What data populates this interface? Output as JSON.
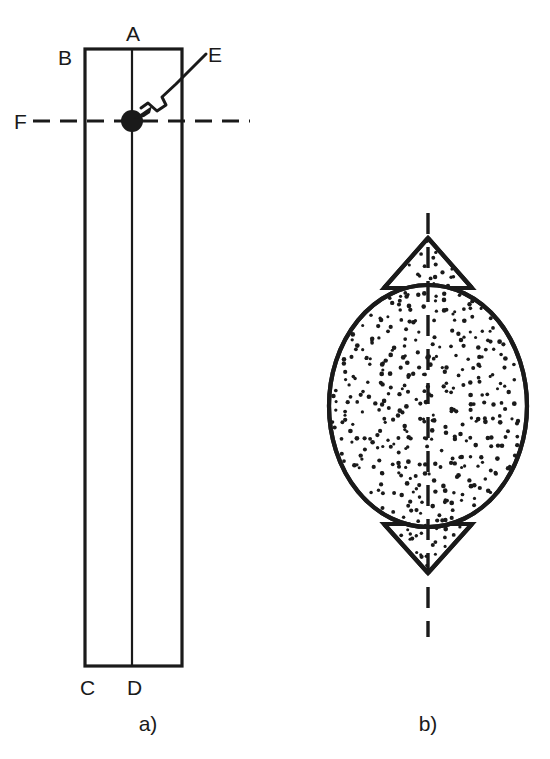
{
  "figure": {
    "background_color": "#ffffff",
    "ink_color": "#1a1a1a"
  },
  "panel_a": {
    "caption": "a)",
    "labels": {
      "top_center": "A",
      "top_left": "B",
      "bottom_left": "C",
      "bottom_center": "D",
      "left_axis": "F",
      "callout": "E"
    },
    "geometry": {
      "rect_left_x": 85,
      "rect_right_x": 182,
      "rect_top_y": 49,
      "rect_bottom_y": 666,
      "center_line_x": 132,
      "horizontal_dashed_y": 121,
      "horizontal_dashed_x1": 33,
      "horizontal_dashed_x2": 250,
      "marker_dot_x": 132,
      "marker_dot_y": 121,
      "marker_dot_r": 11
    }
  },
  "panel_b": {
    "caption": "b)",
    "geometry": {
      "ellipse_center_x": 428,
      "ellipse_center_y": 406,
      "ellipse_rx": 99,
      "ellipse_ry": 121,
      "top_cusp_tip_y": 238,
      "bottom_cusp_tip_y": 573,
      "cusp_half_width": 48,
      "axis_top_y": 213,
      "axis_bottom_y": 637,
      "axis_x": 428
    },
    "fill_pattern": "stipple"
  }
}
